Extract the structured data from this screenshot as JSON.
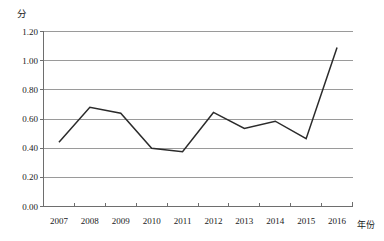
{
  "chart_data": {
    "type": "line",
    "title": "",
    "subtitle": "",
    "xlabel": "年份",
    "ylabel": "分",
    "categories": [
      "2007",
      "2008",
      "2009",
      "2010",
      "2011",
      "2012",
      "2013",
      "2014",
      "2015",
      "2016"
    ],
    "values": [
      0.44,
      0.68,
      0.64,
      0.4,
      0.375,
      0.645,
      0.535,
      0.585,
      0.465,
      1.09
    ],
    "series": [
      {
        "name": "分",
        "values": [
          0.44,
          0.68,
          0.64,
          0.4,
          0.375,
          0.645,
          0.535,
          0.585,
          0.465,
          1.09
        ]
      }
    ],
    "ylim": [
      0.0,
      1.2
    ],
    "ytick_labels": [
      "0.00",
      "0.20",
      "0.40",
      "0.60",
      "0.80",
      "1.00",
      "1.20"
    ],
    "ytick_values": [
      0.0,
      0.2,
      0.4,
      0.6,
      0.8,
      1.0,
      1.2
    ],
    "grid": true,
    "grid_axis": "y",
    "legend": false,
    "legend_position": "none",
    "line_color": "#2b2b2b",
    "grid_color": "#9a9a9a",
    "axis_color": "#6e6e6e",
    "markers": false
  },
  "axes": {
    "y_title": "分",
    "x_title": "年份"
  }
}
